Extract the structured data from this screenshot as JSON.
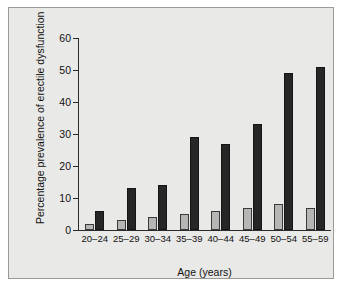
{
  "chart_data": {
    "type": "bar",
    "title": "",
    "xlabel": "Age (years)",
    "ylabel": "Percentage prevalence of erectile dysfunction",
    "categories": [
      "20–24",
      "25–29",
      "30–34",
      "35–39",
      "40–44",
      "45–49",
      "50–54",
      "55–59"
    ],
    "series": [
      {
        "name": "light-bars",
        "color": "#b6b6b4",
        "values": [
          2,
          3,
          4,
          5,
          6,
          7,
          8,
          7
        ]
      },
      {
        "name": "dark-bars",
        "color": "#262626",
        "values": [
          6,
          13,
          14,
          29,
          27,
          33,
          49,
          51
        ]
      }
    ],
    "ylim": [
      0,
      60
    ],
    "yticks": [
      0,
      10,
      20,
      30,
      40,
      50,
      60
    ],
    "ytick_labels": [
      "0",
      "10",
      "20",
      "30",
      "40",
      "50",
      "60"
    ],
    "grid": false,
    "legend": "none",
    "panel_background": "#e9e9e7",
    "axis_color": "#2b2b2b"
  }
}
